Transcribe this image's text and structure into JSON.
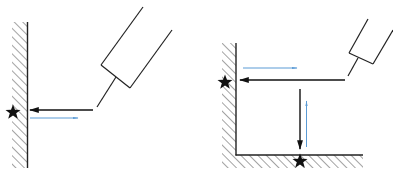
{
  "diagram": {
    "colors": {
      "line": "#222222",
      "incident_arrow": "#111111",
      "reflected_arrow": "#5b9bd5",
      "hatch": "#555555",
      "background": "#ffffff"
    },
    "panels": [
      {
        "id": "left",
        "name": "single-wall",
        "surfaces": [
          "vertical-wall"
        ],
        "targets": 1,
        "incident_arrows": 1,
        "reflected_arrows": 1
      },
      {
        "id": "right",
        "name": "corner",
        "surfaces": [
          "vertical-wall",
          "floor"
        ],
        "targets": 2,
        "incident_arrows": 2,
        "reflected_arrows": 2
      }
    ],
    "icons": {
      "target": "star-icon",
      "device": "laser-device-icon"
    }
  }
}
